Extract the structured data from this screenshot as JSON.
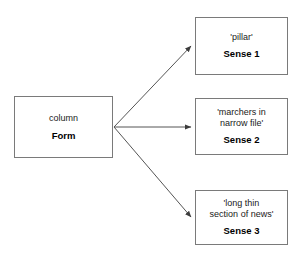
{
  "diagram": {
    "type": "word-sense-fan-out",
    "source": {
      "word": "column",
      "part_of_speech": "Form"
    },
    "senses": [
      {
        "gloss": "'pillar'",
        "label": "Sense 1"
      },
      {
        "gloss": "'marchers in\nnarrow file'",
        "label": "Sense 2"
      },
      {
        "gloss": "'long thin\nsection of news'",
        "label": "Sense 3"
      }
    ],
    "colors": {
      "background": "#ffffff",
      "box_border": "#7a7a7a",
      "arrow": "#4a4a4a",
      "text": "#000000"
    }
  }
}
